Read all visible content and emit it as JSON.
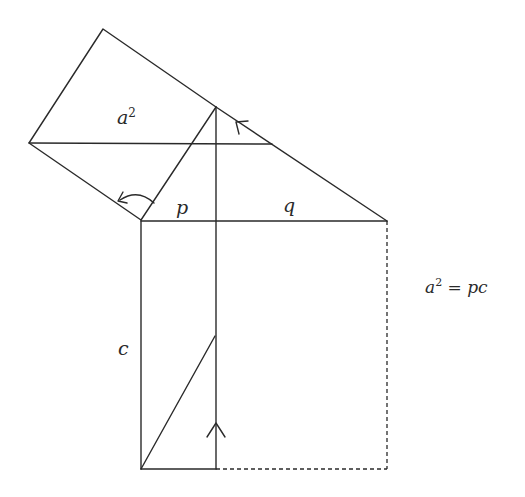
{
  "diagram": {
    "labels": {
      "square_label_base": "a",
      "square_label_exp": "2",
      "p": "p",
      "q": "q",
      "c": "c"
    },
    "equation": {
      "lhs_base": "a",
      "lhs_exp": "2",
      "equals": " = ",
      "rhs": "pc"
    },
    "points": {
      "C_right_angle": [
        141,
        220
      ],
      "apex_foot_top": [
        216,
        107
      ],
      "B": [
        387,
        221
      ],
      "square_top": [
        103,
        29
      ],
      "square_left": [
        29,
        143
      ],
      "shear_line_end": [
        272,
        144
      ],
      "rect_bottom_left": [
        141,
        469
      ],
      "rect_bottom_mid": [
        216,
        469
      ],
      "rect_bottom_right": [
        387,
        469
      ],
      "shear_diag_top": [
        215,
        336
      ]
    },
    "stroke_color": "#2a2a2a"
  }
}
